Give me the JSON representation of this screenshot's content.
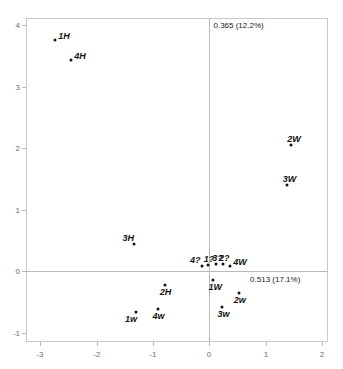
{
  "chart_data": {
    "type": "scatter",
    "title": "",
    "xlabel": "0.513 (17.1%)",
    "ylabel": "0.365 (12.2%)",
    "xlim": [
      -3.25,
      2.1
    ],
    "ylim": [
      -1.15,
      4.12
    ],
    "xticks": [
      "-3",
      "-2",
      "-1",
      "0",
      "1",
      "2"
    ],
    "xtickvalues": [
      -3,
      -2,
      -1,
      0,
      1,
      2
    ],
    "yticks": [
      "4",
      "3",
      "2",
      "1",
      "0",
      "-1"
    ],
    "ytickvalues": [
      4,
      3,
      2,
      1,
      0,
      -1
    ],
    "grid": false,
    "legend": null,
    "axis_lines": "zero-crossing",
    "points": [
      {
        "label": "1H",
        "x": -2.73,
        "y": 3.76,
        "label_pos": "right"
      },
      {
        "label": "4H",
        "x": -2.45,
        "y": 3.43,
        "label_pos": "right"
      },
      {
        "label": "2W",
        "x": 1.45,
        "y": 2.06,
        "label_pos": "above"
      },
      {
        "label": "3W",
        "x": 1.37,
        "y": 1.4,
        "label_pos": "above"
      },
      {
        "label": "3H",
        "x": -1.33,
        "y": 0.45,
        "label_pos": "above-left"
      },
      {
        "label": "4?",
        "x": -0.13,
        "y": 0.09,
        "label_pos": "above-left"
      },
      {
        "label": "1?",
        "x": -0.03,
        "y": 0.11,
        "label_pos": "above"
      },
      {
        "label": "3?",
        "x": 0.12,
        "y": 0.12,
        "label_pos": "above"
      },
      {
        "label": "2?",
        "x": 0.24,
        "y": 0.12,
        "label_pos": "above"
      },
      {
        "label": "4W",
        "x": 0.37,
        "y": 0.09,
        "label_pos": "right"
      },
      {
        "label": "2H",
        "x": -0.79,
        "y": -0.22,
        "label_pos": "below"
      },
      {
        "label": "1W",
        "x": 0.07,
        "y": -0.14,
        "label_pos": "below"
      },
      {
        "label": "2w",
        "x": 0.52,
        "y": -0.35,
        "label_pos": "below"
      },
      {
        "label": "3w",
        "x": 0.23,
        "y": -0.58,
        "label_pos": "below"
      },
      {
        "label": "1w",
        "x": -1.3,
        "y": -0.66,
        "label_pos": "below-left"
      },
      {
        "label": "4w",
        "x": -0.92,
        "y": -0.62,
        "label_pos": "below"
      }
    ]
  },
  "colors": {
    "point": "#111111",
    "frame": "#c9c9c9",
    "axis": "#b9b9b9",
    "tick_text": "#6e6e6e",
    "label_text": "#1a1a1a",
    "background": "#ffffff"
  }
}
